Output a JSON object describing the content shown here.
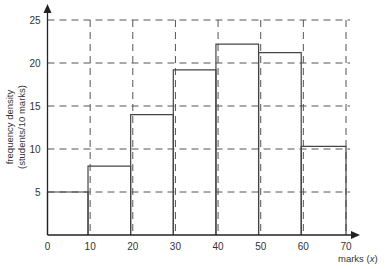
{
  "chart_data": {
    "type": "bar",
    "subtype": "histogram",
    "title": "",
    "xlabel": "marks (x)",
    "xlabel_text": "marks (",
    "xlabel_var": "x",
    "xlabel_close": ")",
    "ylabel": "frequency density (students/10 marks)",
    "ylabel_line1": "frequency density",
    "ylabel_line2": "(students/10 marks)",
    "xlim": [
      0,
      70
    ],
    "ylim": [
      0,
      25
    ],
    "x_ticks": [
      0,
      10,
      20,
      30,
      40,
      50,
      60,
      70
    ],
    "y_ticks": [
      5,
      10,
      15,
      20,
      25
    ],
    "grid": "dashed",
    "bins": [
      {
        "from": 0,
        "to": 9.5,
        "value": 5
      },
      {
        "from": 9.5,
        "to": 19.5,
        "value": 8
      },
      {
        "from": 19.5,
        "to": 29.5,
        "value": 14
      },
      {
        "from": 29.5,
        "to": 39.5,
        "value": 19.2
      },
      {
        "from": 39.5,
        "to": 49.5,
        "value": 22.2
      },
      {
        "from": 49.5,
        "to": 59.5,
        "value": 21.2
      },
      {
        "from": 59.5,
        "to": 70,
        "value": 10.3
      }
    ],
    "colors": {
      "bar_edge": "#444444",
      "grid": "#555555",
      "axis": "#222222",
      "bar_fill": "#ffffff"
    }
  }
}
